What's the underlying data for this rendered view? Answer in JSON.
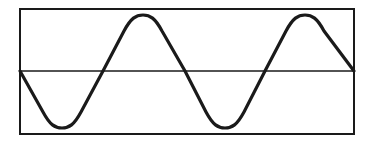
{
  "figure": {
    "type": "waveform-diagram",
    "colors": {
      "background": "#ffffff",
      "stroke": "#1a1a1a"
    },
    "frame": {
      "x": 20,
      "y": 9,
      "width": 334,
      "height": 125,
      "stroke_width": 2
    },
    "axis": {
      "y": 71,
      "x1": 20,
      "x2": 354,
      "stroke_width": 1.3
    },
    "waveform": {
      "stroke_width": 3.2,
      "start": "midline-descending",
      "cycles": 2,
      "period_px": 163,
      "key_points": [
        {
          "label": "start",
          "x": 20,
          "y": 71
        },
        {
          "label": "trough-1",
          "x": 62,
          "y": 128
        },
        {
          "label": "crossing-1",
          "x": 103,
          "y": 71
        },
        {
          "label": "peak-1",
          "x": 143,
          "y": 15
        },
        {
          "label": "crossing-2",
          "x": 185,
          "y": 71
        },
        {
          "label": "trough-2",
          "x": 225,
          "y": 128
        },
        {
          "label": "crossing-3",
          "x": 265,
          "y": 71
        },
        {
          "label": "peak-2",
          "x": 305,
          "y": 15
        },
        {
          "label": "end",
          "x": 354,
          "y": 71
        }
      ]
    }
  }
}
